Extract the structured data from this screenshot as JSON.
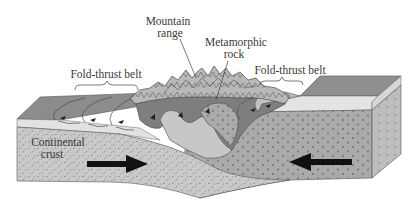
{
  "figure": {
    "type": "geologic-block-diagram",
    "labels": {
      "mountain_range": [
        "Mountain",
        "range"
      ],
      "metamorphic_rock": [
        "Metamorphic",
        "rock"
      ],
      "fold_thrust_belt_left": "Fold-thrust belt",
      "fold_thrust_belt_right": "Fold-thrust belt",
      "continental_crust": [
        "Continental",
        "crust"
      ]
    },
    "arrows": [
      {
        "name": "left-plate-motion",
        "direction": "right"
      },
      {
        "name": "right-plate-motion",
        "direction": "left"
      }
    ],
    "colors": {
      "top_surface": "#8e8e8e",
      "light_layer": "#e2e2e2",
      "left_crust": "#c8c8c8",
      "right_crust": "#a9a9a9",
      "fold_dark": "#7c7c7c",
      "mountain_light": "#bdbdbd",
      "outline": "#4a4a4a",
      "arrow": "#111111",
      "text": "#3a3a3a"
    }
  }
}
